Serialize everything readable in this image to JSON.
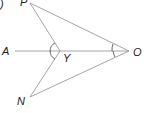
{
  "diagram": {
    "type": "geometry",
    "partial_label": ")",
    "points": {
      "P": {
        "label": "P",
        "x": 30,
        "y": 3
      },
      "A": {
        "label": "A",
        "x": 15,
        "y": 51
      },
      "Y": {
        "label": "Y",
        "x": 60,
        "y": 51
      },
      "O": {
        "label": "O",
        "x": 129,
        "y": 51
      },
      "N": {
        "label": "N",
        "x": 30,
        "y": 97
      }
    },
    "segments": [
      "PO",
      "PY",
      "AO",
      "YN",
      "NO"
    ],
    "angle_marks": [
      "PYN",
      "POY",
      "YON"
    ],
    "colors": {
      "line": "#9a9a9a",
      "label": "#222222",
      "arc": "#555555"
    }
  }
}
